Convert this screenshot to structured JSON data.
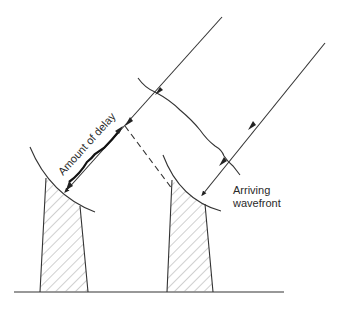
{
  "diagram": {
    "type": "radio interferometer delay illustration",
    "labels": {
      "delay": "Amount of delay",
      "wavefront_line1": "Arriving",
      "wavefront_line2": "wavefront"
    },
    "elements": {
      "antennas": [
        "left-antenna",
        "right-antenna"
      ],
      "rays": [
        "left-incoming-ray",
        "right-incoming-ray"
      ],
      "wavefront": "arriving-wavefront",
      "delay_path": "dashed-delay-line",
      "ground": "ground-line"
    },
    "colors": {
      "line": "#333333",
      "background": "#ffffff"
    }
  }
}
